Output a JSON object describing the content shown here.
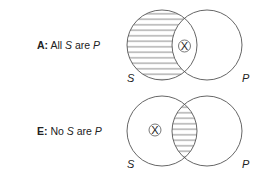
{
  "diagrams": [
    {
      "id": "A",
      "letter": "A:",
      "text_pre": "All ",
      "subject": "S",
      "text_mid": " are ",
      "predicate": "P",
      "shaded_region": "S only",
      "x_mark_region": "S and P",
      "set_labels": {
        "left": "S",
        "right": "P"
      },
      "x_symbol": "X"
    },
    {
      "id": "E",
      "letter": "E:",
      "text_pre": "No ",
      "subject": "S",
      "text_mid": " are ",
      "predicate": "P",
      "shaded_region": "S and P",
      "x_mark_region": "S only",
      "set_labels": {
        "left": "S",
        "right": "P"
      },
      "x_symbol": "X"
    }
  ],
  "colors": {
    "stroke": "#555555",
    "text": "#222222",
    "background": "#ffffff"
  }
}
